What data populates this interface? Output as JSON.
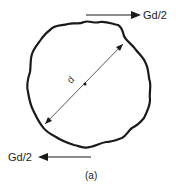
{
  "diagram": {
    "top_force_label": "Gd/2",
    "bottom_force_label": "Gd/2",
    "diameter_label": "d",
    "caption": "(a)",
    "colors": {
      "outline": "#1a1a1a",
      "diameter_line": "#444444",
      "text": "#222222"
    }
  }
}
